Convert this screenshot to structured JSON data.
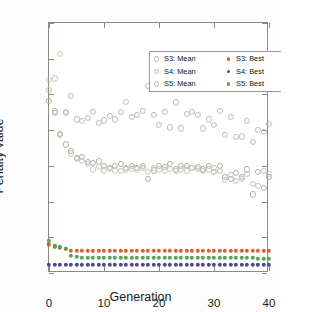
{
  "chart_data": {
    "type": "scatter",
    "title": "",
    "xlabel": "Generation",
    "ylabel": "Penalty value",
    "xlim": [
      0,
      40
    ],
    "ylim": [
      -1.6,
      1.2
    ],
    "xticks": [
      0,
      10,
      20,
      30,
      40
    ],
    "yticks": [
      1.2,
      0.8,
      0.4,
      0,
      -0.4,
      -0.8,
      -1.2,
      -1.6
    ],
    "xticklabels": [
      "0",
      "10",
      "20",
      "30",
      "40"
    ],
    "yticklabels": [
      "1.2",
      "0.8",
      "0.4",
      "0",
      "-0.4",
      "-0.8",
      "-1.2",
      "-1.6"
    ],
    "grid": false,
    "legend_position": "upper center",
    "legend_entries": [
      {
        "label": "S3: Mean",
        "marker": "open-circle",
        "color": "#b9b9ae"
      },
      {
        "label": "S4: Mean",
        "marker": "open-circle",
        "color": "#b9b9ae"
      },
      {
        "label": "S5: Mean",
        "marker": "open-circle",
        "color": "#c9c9bd"
      },
      {
        "label": "S3: Best",
        "marker": "filled-circle",
        "color": "#d9622b"
      },
      {
        "label": "S4: Best",
        "marker": "filled-circle",
        "color": "#4b4b8f"
      },
      {
        "label": "S5: Best",
        "marker": "filled-circle",
        "color": "#58a05c"
      }
    ],
    "x": [
      0,
      1,
      2,
      3,
      4,
      5,
      6,
      7,
      8,
      9,
      10,
      11,
      12,
      13,
      14,
      15,
      16,
      17,
      18,
      19,
      20,
      21,
      22,
      23,
      24,
      25,
      26,
      27,
      28,
      29,
      30,
      31,
      32,
      33,
      34,
      35,
      36,
      37,
      38,
      39,
      40
    ],
    "series": [
      {
        "name": "S3: Mean",
        "marker": "open-circle",
        "color": "#b0b0a4",
        "values": [
          0.33,
          0.21,
          -0.04,
          -0.16,
          -0.23,
          -0.31,
          -0.3,
          -0.36,
          -0.37,
          -0.35,
          -0.4,
          -0.42,
          -0.4,
          -0.38,
          -0.42,
          -0.4,
          -0.42,
          -0.4,
          -0.55,
          -0.45,
          -0.4,
          -0.41,
          -0.38,
          -0.44,
          -0.4,
          -0.4,
          -0.42,
          -0.41,
          -0.44,
          -0.4,
          -0.47,
          -0.4,
          -0.52,
          -0.55,
          -0.48,
          -0.52,
          -0.44,
          -0.72,
          -0.47,
          -0.65,
          -0.52
        ]
      },
      {
        "name": "S4: Mean",
        "marker": "open-circle",
        "color": "#bdbdb1",
        "values": [
          0.45,
          0.19,
          -0.05,
          0.19,
          0.38,
          0.12,
          0.1,
          0.14,
          0.2,
          0.08,
          0.11,
          0.16,
          0.12,
          0.2,
          0.32,
          0.15,
          0.17,
          0.22,
          0.5,
          0.17,
          0.06,
          0.2,
          0.03,
          0.31,
          0.02,
          0.18,
          0.2,
          0.17,
          0.02,
          0.12,
          0.06,
          0.22,
          -0.05,
          0.15,
          -0.08,
          -0.07,
          0.1,
          -0.13,
          0.0,
          -0.02,
          0.07
        ]
      },
      {
        "name": "S5: Mean",
        "marker": "open-circle",
        "color": "#c6c6ba",
        "values": [
          0.56,
          0.58,
          0.85,
          0.2,
          -0.26,
          -0.32,
          -0.34,
          -0.38,
          -0.44,
          -0.41,
          -0.45,
          -0.43,
          -0.45,
          -0.46,
          -0.44,
          -0.43,
          -0.44,
          -0.42,
          -0.47,
          -0.42,
          -0.44,
          -0.45,
          -0.43,
          -0.46,
          -0.44,
          -0.45,
          -0.42,
          -0.43,
          -0.46,
          -0.44,
          -0.42,
          -0.46,
          -0.56,
          -0.5,
          -0.57,
          -0.55,
          -0.49,
          -0.6,
          -0.62,
          -0.46,
          -0.49
        ]
      },
      {
        "name": "S3: Best",
        "marker": "filled-circle",
        "color": "#d9622b",
        "values": [
          -1.28,
          -1.3,
          -1.32,
          -1.33,
          -1.35,
          -1.35,
          -1.35,
          -1.35,
          -1.35,
          -1.35,
          -1.35,
          -1.35,
          -1.35,
          -1.35,
          -1.35,
          -1.35,
          -1.35,
          -1.35,
          -1.35,
          -1.35,
          -1.35,
          -1.35,
          -1.35,
          -1.35,
          -1.35,
          -1.35,
          -1.35,
          -1.35,
          -1.35,
          -1.35,
          -1.35,
          -1.35,
          -1.35,
          -1.35,
          -1.35,
          -1.35,
          -1.35,
          -1.35,
          -1.35,
          -1.35,
          -1.35
        ]
      },
      {
        "name": "S4: Best",
        "marker": "filled-circle",
        "color": "#4b4b8f",
        "values": [
          -1.51,
          -1.51,
          -1.51,
          -1.51,
          -1.51,
          -1.51,
          -1.51,
          -1.51,
          -1.51,
          -1.51,
          -1.51,
          -1.51,
          -1.51,
          -1.51,
          -1.51,
          -1.51,
          -1.51,
          -1.51,
          -1.51,
          -1.51,
          -1.51,
          -1.51,
          -1.51,
          -1.51,
          -1.51,
          -1.51,
          -1.51,
          -1.51,
          -1.51,
          -1.51,
          -1.51,
          -1.51,
          -1.51,
          -1.51,
          -1.51,
          -1.51,
          -1.51,
          -1.51,
          -1.51,
          -1.51,
          -1.51
        ]
      },
      {
        "name": "S5: Best",
        "marker": "filled-circle",
        "color": "#58a05c",
        "values": [
          -1.24,
          -1.3,
          -1.31,
          -1.33,
          -1.41,
          -1.42,
          -1.43,
          -1.43,
          -1.43,
          -1.43,
          -1.43,
          -1.43,
          -1.43,
          -1.43,
          -1.43,
          -1.43,
          -1.43,
          -1.43,
          -1.43,
          -1.43,
          -1.43,
          -1.43,
          -1.43,
          -1.43,
          -1.43,
          -1.43,
          -1.43,
          -1.43,
          -1.43,
          -1.43,
          -1.43,
          -1.43,
          -1.43,
          -1.43,
          -1.43,
          -1.43,
          -1.43,
          -1.43,
          -1.44,
          -1.44,
          -1.44
        ]
      }
    ]
  }
}
